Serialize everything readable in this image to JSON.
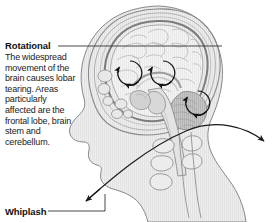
{
  "figure": {
    "name": "rotational-brain-injury-whiplash-diagram",
    "width": 275,
    "height": 222,
    "background_color": "#ffffff"
  },
  "callouts": {
    "rotational": {
      "title": "Rotational",
      "body": "The widespread movement of the brain causes lobar tearing. Areas particularly affected are the frontal lobe, brain stem and cerebellum.",
      "leader_color": "#333333"
    },
    "whiplash": {
      "title": "Whiplash",
      "leader_color": "#333333"
    }
  },
  "illustration": {
    "description": "Sagittal cross-section of a human head and neck showing the brain, brain stem, cerebellum and cervical vertebrae",
    "outline_color": "#6e6e6e",
    "tissue_fill": "#eaeaea",
    "brain_fill": "#f2f2f2",
    "cerebellum_fill": "#bdbdbd",
    "arrow_color": "#1a1a1a",
    "rotation_markers": [
      {
        "label": "frontal-lobe-rotation",
        "cx": 130,
        "cy": 73,
        "r": 12
      },
      {
        "label": "central-brain-rotation",
        "cx": 163,
        "cy": 73,
        "r": 12
      },
      {
        "label": "cerebellum-rotation",
        "cx": 198,
        "cy": 103,
        "r": 12
      }
    ],
    "whiplash_arc": {
      "label": "whiplash-double-arrow",
      "start": [
        86,
        201
      ],
      "end": [
        266,
        142
      ],
      "peak": [
        186,
        129
      ]
    }
  },
  "colors": {
    "text": "#1a1a1a",
    "title": "#111111",
    "line": "#333333",
    "accent_gray": "#bdbdbd"
  }
}
